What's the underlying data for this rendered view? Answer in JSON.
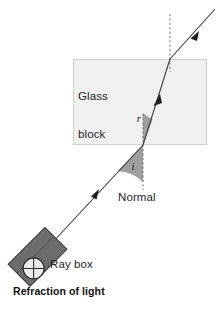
{
  "figure": {
    "caption": "Refraction of light",
    "labels": {
      "glass_block": "Glass\nblock",
      "glass_block_line1": "Glass",
      "glass_block_line2": "block",
      "normal": "Normal",
      "ray_box": "Ray box",
      "angle_of_incidence": "i",
      "angle_of_refraction": "r"
    },
    "colors": {
      "glass_fill": "#f0f0f0",
      "glass_stroke": "#cfcfcf",
      "ray": "#3a3a3a",
      "normal_dash": "#6e6e6e",
      "angle_wedge": "#9a9a9a",
      "ray_box_fill": "#6d6d6d",
      "ray_box_stroke": "#3d3d3d",
      "aperture_fill": "#ececec",
      "text": "#1a1a1a",
      "background": "#ffffff"
    },
    "geometry": {
      "glass_block": {
        "x": 73,
        "y": 59,
        "width": 134,
        "height": 86
      },
      "entry_point": {
        "x": 143,
        "y": 145
      },
      "exit_point": {
        "x": 170,
        "y": 59
      },
      "ray_source": {
        "x": 52,
        "y": 243
      },
      "ray_end": {
        "x": 213,
        "y": 10
      },
      "normal_lower": {
        "x": 143,
        "y_top": 115,
        "y_bottom": 190
      },
      "normal_upper": {
        "x": 170,
        "y_top": 14,
        "y_bottom": 72
      }
    },
    "annotations": [
      "Light ray from ray box travels to glass block",
      "Ray bends toward the normal on entering the glass",
      "Ray bends away from the normal on leaving the glass"
    ]
  }
}
